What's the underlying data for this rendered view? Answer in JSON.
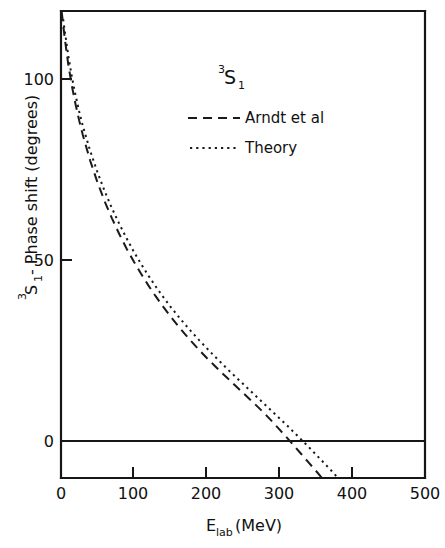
{
  "figure": {
    "title_superscript": "3",
    "title_base": "S",
    "title_subscript": "1"
  },
  "axes": {
    "x": {
      "label_base": "E",
      "label_sub": "lab",
      "label_unit": "(MeV)",
      "label_full": "Elab (MeV)",
      "ticks": [
        0,
        100,
        200,
        300,
        400,
        500
      ],
      "tick_labels": [
        "0",
        "100",
        "200",
        "300",
        "400",
        "500"
      ],
      "range": [
        0,
        500
      ]
    },
    "y": {
      "label_sup": "3",
      "label_base": "S",
      "label_sub": "1",
      "label_rest": " - Phase shift (degrees)",
      "label_full": "3S1 - Phase shift (degrees)",
      "ticks": [
        0,
        50,
        100
      ],
      "tick_labels": [
        "0",
        "50",
        "100"
      ],
      "range": [
        -10,
        120
      ]
    }
  },
  "legend": {
    "entries": [
      {
        "label": "Arndt et al",
        "style": "dashed"
      },
      {
        "label": "Theory",
        "style": "dotted"
      }
    ]
  },
  "colors": {
    "ink": "#161616",
    "background": "#ffffff"
  },
  "chart_data": {
    "type": "line",
    "xlabel": "Elab (MeV)",
    "ylabel": "3S1 - Phase shift (degrees)",
    "xlim": [
      0,
      500
    ],
    "ylim": [
      -10,
      120
    ],
    "grid": false,
    "legend_position": "upper-center",
    "xticks": [
      0,
      100,
      200,
      300,
      400,
      500
    ],
    "yticks": [
      0,
      50,
      100
    ],
    "series": [
      {
        "name": "Arndt et al",
        "style": "dashed",
        "x": [
          1,
          3,
          5,
          10,
          15,
          20,
          25,
          30,
          40,
          50,
          60,
          70,
          80,
          90,
          100,
          110,
          120,
          130,
          140,
          150,
          160,
          170,
          180,
          190,
          200,
          210,
          220,
          230,
          240,
          250,
          260,
          270,
          280,
          290,
          300,
          310,
          320,
          330,
          340,
          350,
          360,
          370,
          380,
          390,
          400,
          405
        ],
        "y": [
          118.5,
          115.0,
          111.5,
          104.0,
          98.0,
          93.0,
          88.5,
          84.5,
          77.5,
          71.5,
          66.2,
          61.5,
          57.2,
          53.2,
          49.6,
          46.2,
          43.0,
          40.0,
          37.2,
          34.5,
          32.0,
          29.6,
          27.3,
          25.1,
          23.0,
          21.0,
          19.0,
          17.1,
          15.2,
          13.3,
          11.4,
          9.5,
          7.5,
          5.4,
          3.2,
          1.0,
          -1.3,
          -3.6,
          -5.9,
          -8.2,
          -10.6,
          -13.0,
          -15.4,
          -17.8,
          -20.2,
          -21.4
        ]
      },
      {
        "name": "Theory",
        "style": "dotted",
        "x": [
          1,
          3,
          5,
          10,
          15,
          20,
          25,
          30,
          40,
          50,
          60,
          70,
          80,
          90,
          100,
          110,
          120,
          130,
          140,
          150,
          160,
          170,
          180,
          190,
          200,
          210,
          220,
          230,
          240,
          250,
          260,
          270,
          280,
          290,
          300,
          310,
          320,
          330,
          340,
          350,
          360,
          370,
          380,
          390,
          400,
          410,
          420,
          430,
          437
        ],
        "y": [
          119.5,
          116.5,
          113.5,
          106.5,
          100.5,
          95.5,
          91.0,
          87.0,
          80.2,
          74.3,
          69.0,
          64.3,
          60.0,
          56.0,
          52.3,
          48.9,
          45.7,
          42.7,
          39.9,
          37.2,
          34.7,
          32.3,
          30.0,
          27.8,
          25.7,
          23.6,
          21.6,
          19.6,
          17.7,
          15.8,
          13.9,
          12.0,
          10.1,
          8.2,
          6.3,
          4.4,
          2.4,
          0.4,
          -1.6,
          -3.7,
          -5.8,
          -7.9,
          -10.1,
          -12.3,
          -14.5,
          -16.8,
          -19.1,
          -21.4,
          -23.0
        ]
      }
    ],
    "annotations": [
      {
        "text": "3S1",
        "role": "panel-title"
      }
    ]
  }
}
